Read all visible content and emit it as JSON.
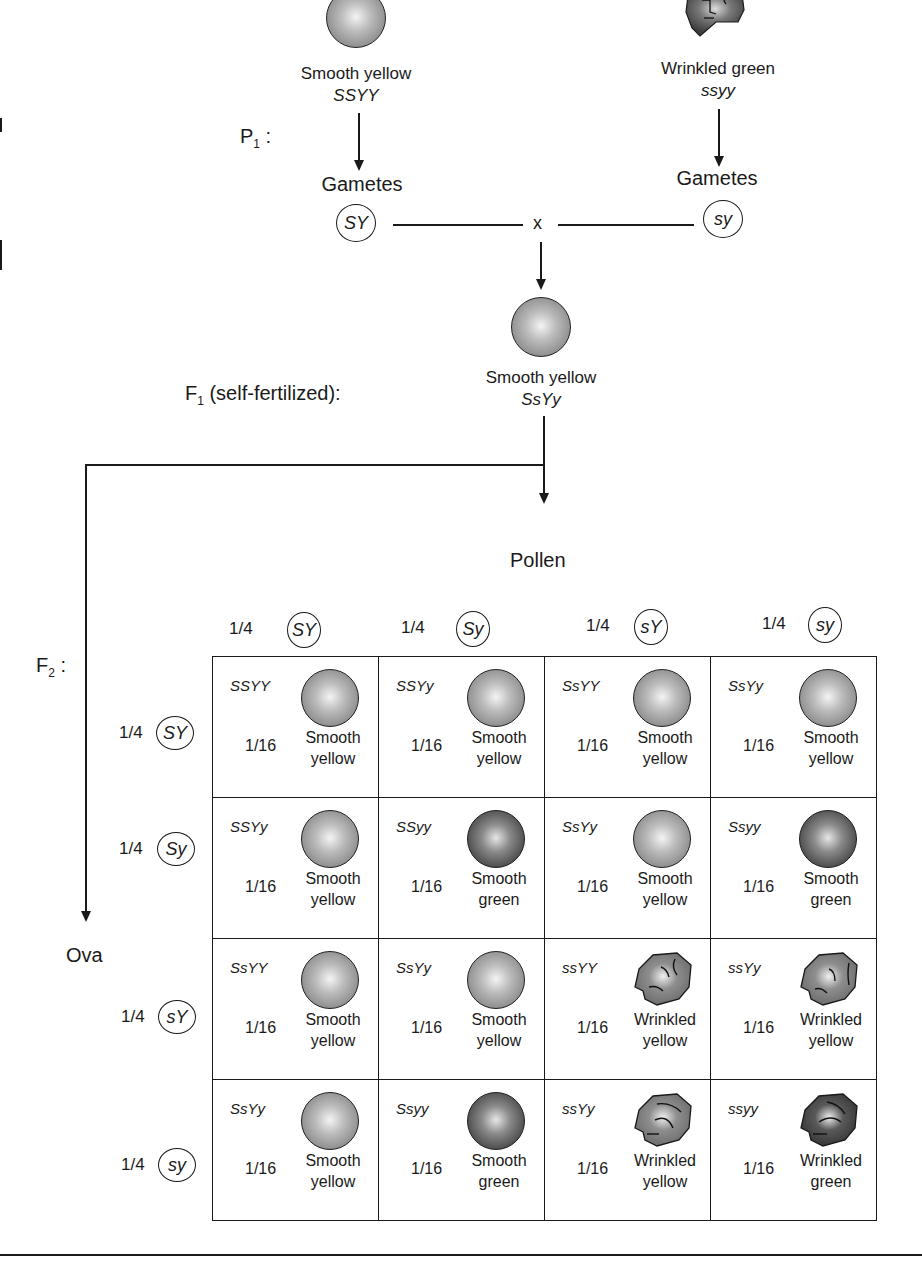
{
  "diagram": {
    "p1": {
      "label": "P",
      "label_sub": "1",
      "label_suffix": " :",
      "parent_left": {
        "phenotype": "Smooth yellow",
        "genotype": "SSYY",
        "shape": "smooth",
        "color": "yellow"
      },
      "parent_right": {
        "phenotype": "Wrinkled green",
        "genotype": "ssyy",
        "shape": "wrinkled",
        "color": "green"
      },
      "gametes_label_left": "Gametes",
      "gametes_label_right": "Gametes",
      "gamete_left": "SY",
      "gamete_right": "sy",
      "cross_symbol": "x"
    },
    "f1": {
      "label": "F",
      "label_sub": "1",
      "label_suffix": " (self-fertilized):",
      "phenotype": "Smooth yellow",
      "genotype": "SsYy"
    },
    "f2": {
      "label": "F",
      "label_sub": "2",
      "label_suffix": " :",
      "pollen_label": "Pollen",
      "ova_label": "Ova",
      "pollen_gametes": [
        {
          "prob": "1/4",
          "allele": "SY"
        },
        {
          "prob": "1/4",
          "allele": "Sy"
        },
        {
          "prob": "1/4",
          "allele": "sY"
        },
        {
          "prob": "1/4",
          "allele": "sy"
        }
      ],
      "ova_gametes": [
        {
          "prob": "1/4",
          "allele": "SY"
        },
        {
          "prob": "1/4",
          "allele": "Sy"
        },
        {
          "prob": "1/4",
          "allele": "sY"
        },
        {
          "prob": "1/4",
          "allele": "sy"
        }
      ],
      "punnett": [
        [
          {
            "genotype": "SSYY",
            "fraction": "1/16",
            "pheno1": "Smooth",
            "pheno2": "yellow",
            "shape": "smooth",
            "color": "yellow"
          },
          {
            "genotype": "SSYy",
            "fraction": "1/16",
            "pheno1": "Smooth",
            "pheno2": "yellow",
            "shape": "smooth",
            "color": "yellow"
          },
          {
            "genotype": "SsYY",
            "fraction": "1/16",
            "pheno1": "Smooth",
            "pheno2": "yellow",
            "shape": "smooth",
            "color": "yellow"
          },
          {
            "genotype": "SsYy",
            "fraction": "1/16",
            "pheno1": "Smooth",
            "pheno2": "yellow",
            "shape": "smooth",
            "color": "yellow"
          }
        ],
        [
          {
            "genotype": "SSYy",
            "fraction": "1/16",
            "pheno1": "Smooth",
            "pheno2": "yellow",
            "shape": "smooth",
            "color": "yellow"
          },
          {
            "genotype": "SSyy",
            "fraction": "1/16",
            "pheno1": "Smooth",
            "pheno2": "green",
            "shape": "smooth",
            "color": "green"
          },
          {
            "genotype": "SsYy",
            "fraction": "1/16",
            "pheno1": "Smooth",
            "pheno2": "yellow",
            "shape": "smooth",
            "color": "yellow"
          },
          {
            "genotype": "Ssyy",
            "fraction": "1/16",
            "pheno1": "Smooth",
            "pheno2": "green",
            "shape": "smooth",
            "color": "green"
          }
        ],
        [
          {
            "genotype": "SsYY",
            "fraction": "1/16",
            "pheno1": "Smooth",
            "pheno2": "yellow",
            "shape": "smooth",
            "color": "yellow"
          },
          {
            "genotype": "SsYy",
            "fraction": "1/16",
            "pheno1": "Smooth",
            "pheno2": "yellow",
            "shape": "smooth",
            "color": "yellow"
          },
          {
            "genotype": "ssYY",
            "fraction": "1/16",
            "pheno1": "Wrinkled",
            "pheno2": "yellow",
            "shape": "wrinkled",
            "color": "yellow"
          },
          {
            "genotype": "ssYy",
            "fraction": "1/16",
            "pheno1": "Wrinkled",
            "pheno2": "yellow",
            "shape": "wrinkled",
            "color": "yellow"
          }
        ],
        [
          {
            "genotype": "SsYy",
            "fraction": "1/16",
            "pheno1": "Smooth",
            "pheno2": "yellow",
            "shape": "smooth",
            "color": "yellow"
          },
          {
            "genotype": "Ssyy",
            "fraction": "1/16",
            "pheno1": "Smooth",
            "pheno2": "green",
            "shape": "smooth",
            "color": "green"
          },
          {
            "genotype": "ssYy",
            "fraction": "1/16",
            "pheno1": "Wrinkled",
            "pheno2": "yellow",
            "shape": "wrinkled",
            "color": "yellow"
          },
          {
            "genotype": "ssyy",
            "fraction": "1/16",
            "pheno1": "Wrinkled",
            "pheno2": "green",
            "shape": "wrinkled",
            "color": "green"
          }
        ]
      ]
    },
    "colors": {
      "ink": "#1a1a1a",
      "yellow_pea_mid": "#9a9a9a",
      "green_pea_mid": "#555555"
    }
  }
}
